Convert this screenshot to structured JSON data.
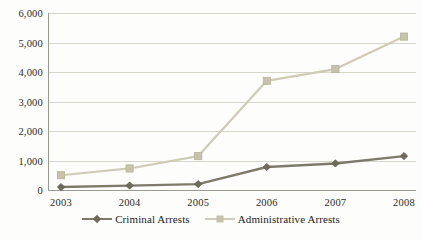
{
  "chart_data": {
    "type": "line",
    "title": "",
    "xlabel": "",
    "ylabel": "",
    "categories": [
      "2003",
      "2004",
      "2005",
      "2006",
      "2007",
      "2008"
    ],
    "ylim": [
      0,
      6000
    ],
    "ytick_values": [
      0,
      1000,
      2000,
      3000,
      4000,
      5000,
      6000
    ],
    "ytick_labels": [
      "0",
      "1,000",
      "2,000",
      "3,000",
      "4,000",
      "5,000",
      "6,000"
    ],
    "grid": true,
    "legend_position": "bottom-center",
    "series": [
      {
        "name": "Criminal Arrests",
        "color": "#7d7a6c",
        "marker": "diamond",
        "values": [
          100,
          150,
          200,
          780,
          900,
          1150
        ]
      },
      {
        "name": "Administrative Arrests",
        "color": "#cfcbb6",
        "marker": "square",
        "values": [
          500,
          730,
          1150,
          3700,
          4100,
          5200
        ]
      }
    ]
  },
  "legend": {
    "entries": [
      {
        "label": "Criminal Arrests",
        "marker_icon": "diamond-marker-icon"
      },
      {
        "label": "Administrative Arrests",
        "marker_icon": "square-marker-icon"
      }
    ]
  },
  "caption": {
    "partial_text": ""
  }
}
